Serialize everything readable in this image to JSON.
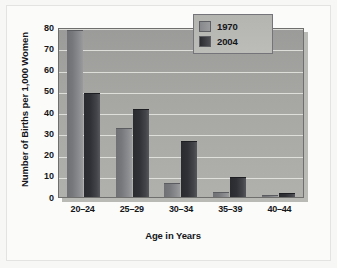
{
  "chart_data": {
    "type": "bar",
    "title": "",
    "xlabel": "Age in Years",
    "ylabel": "Number of Births per 1,000 Women",
    "categories": [
      "20–24",
      "25–29",
      "30–34",
      "35–39",
      "40–44"
    ],
    "series": [
      {
        "name": "1970",
        "values": [
          78,
          32,
          6,
          2,
          0.5
        ],
        "color": "#87888b"
      },
      {
        "name": "2004",
        "values": [
          48.5,
          41,
          26,
          9,
          1.5
        ],
        "color": "#2b2c30"
      }
    ],
    "ylim": [
      0,
      80
    ],
    "ytick_labels": [
      "80",
      "70",
      "60",
      "50",
      "40",
      "30",
      "20",
      "10",
      "0"
    ],
    "ytick_values": [
      80,
      70,
      60,
      50,
      40,
      30,
      20,
      10,
      0
    ],
    "grid": true,
    "legend_position": "top-right",
    "plot_background": "#a6a6a3",
    "gridline_color": "#e8e8e4"
  },
  "legend": {
    "entries": [
      {
        "label": "1970",
        "swatch": "legend-swatch-1970"
      },
      {
        "label": "2004",
        "swatch": "legend-swatch-2004"
      }
    ]
  }
}
